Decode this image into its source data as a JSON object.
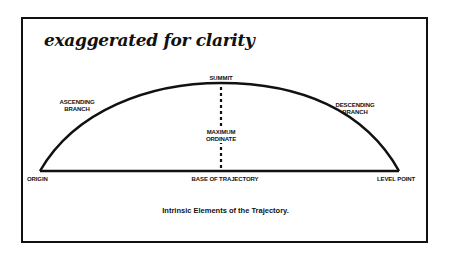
{
  "title": "exaggerated for clarity",
  "caption": "Intrinsic Elements of the Trajectory.",
  "labels": {
    "summit": "SUMMIT",
    "ascending_line1": "ASCENDING",
    "ascending_line2": "BRANCH",
    "descending_line1": "DESCENDING",
    "descending_line2": "BRANCH",
    "max_ordinate_line1": "MAXIMUM",
    "max_ordinate_line2": "ORDINATE",
    "origin": "ORIGIN",
    "base": "BASE OF TRAJECTORY",
    "level_point": "LEVEL POINT"
  },
  "geometry": {
    "origin": [
      40,
      171
    ],
    "level_point": [
      399,
      171
    ],
    "summit": [
      221,
      83
    ]
  },
  "colors": {
    "ink": "#111111",
    "background": "#ffffff"
  }
}
